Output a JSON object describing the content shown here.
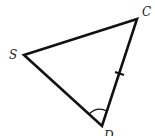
{
  "diagram": {
    "type": "triangle",
    "vertices": {
      "S": {
        "label": "S",
        "x": 24,
        "y": 55
      },
      "C": {
        "label": "C",
        "x": 137,
        "y": 19
      },
      "D": {
        "label": "D",
        "x": 102,
        "y": 126
      }
    },
    "markings": {
      "tick_mark_side": "CD",
      "angle_arc_vertex": "D"
    },
    "colors": {
      "stroke": "#111111",
      "label": "#222222"
    }
  }
}
